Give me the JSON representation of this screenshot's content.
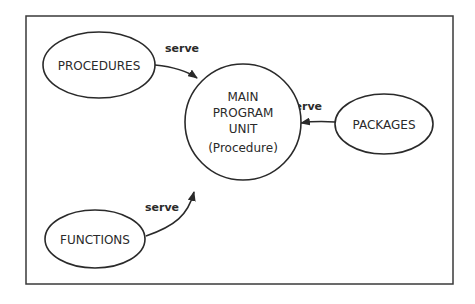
{
  "diagram": {
    "frame": {
      "x": 26,
      "y": 16,
      "width": 427,
      "height": 268
    },
    "nodes": [
      {
        "id": "main",
        "shape": "circle",
        "cx": 243,
        "cy": 122,
        "r": 58,
        "lines": [
          "MAIN",
          "PROGRAM",
          "UNIT",
          "(Procedure)"
        ]
      },
      {
        "id": "procedures",
        "shape": "ellipse",
        "cx": 99,
        "cy": 65,
        "rx": 56,
        "ry": 33,
        "label": "PROCEDURES"
      },
      {
        "id": "packages",
        "shape": "ellipse",
        "cx": 384,
        "cy": 124,
        "rx": 49,
        "ry": 30,
        "label": "PACKAGES"
      },
      {
        "id": "functions",
        "shape": "ellipse",
        "cx": 95,
        "cy": 239,
        "rx": 50,
        "ry": 29,
        "label": "FUNCTIONS"
      }
    ],
    "edges": [
      {
        "from": "procedures",
        "to": "main",
        "label": "serve"
      },
      {
        "from": "packages",
        "to": "main",
        "label": "serve"
      },
      {
        "from": "functions",
        "to": "main",
        "label": "serve"
      }
    ]
  }
}
